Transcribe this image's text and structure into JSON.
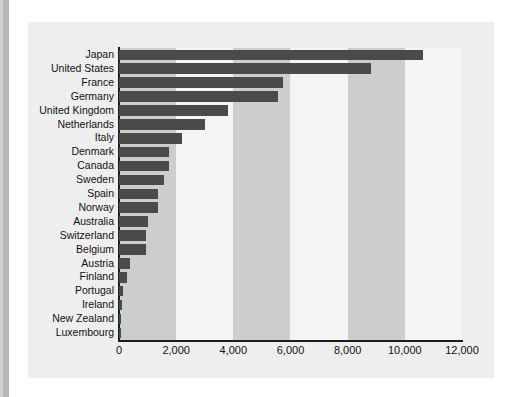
{
  "chart_data": {
    "type": "bar",
    "orientation": "horizontal",
    "title": "",
    "subtitle": "",
    "xlabel": "",
    "ylabel": "",
    "xlim": [
      0,
      12000
    ],
    "grid": false,
    "alternating_bands": true,
    "legend": null,
    "bar_color": "#4a4a4a",
    "band_color": "#cdcdcd",
    "panel_color": "#eeeeee",
    "plot_color": "#f4f4f4",
    "axis_color": "#1d1d1d",
    "xticks": [
      0,
      2000,
      4000,
      6000,
      8000,
      10000,
      12000
    ],
    "xtick_labels": [
      "0",
      "2,000",
      "4,000",
      "6,000",
      "8,000",
      "10,000",
      "12,000"
    ],
    "categories": [
      "Japan",
      "United States",
      "France",
      "Germany",
      "United Kingdom",
      "Netherlands",
      "Italy",
      "Denmark",
      "Canada",
      "Sweden",
      "Spain",
      "Norway",
      "Australia",
      "Switzerland",
      "Belgium",
      "Austria",
      "Finland",
      "Portugal",
      "Ireland",
      "New Zealand",
      "Luxembourg"
    ],
    "values": [
      10630,
      8810,
      5750,
      5580,
      3820,
      3020,
      2210,
      1760,
      1750,
      1590,
      1380,
      1360,
      1010,
      940,
      930,
      400,
      290,
      130,
      90,
      60,
      50
    ]
  }
}
